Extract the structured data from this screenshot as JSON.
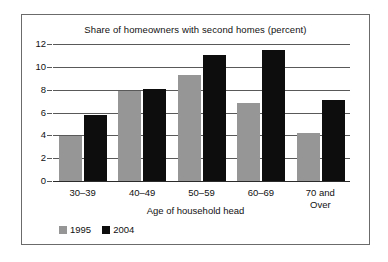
{
  "chart_data": {
    "type": "bar",
    "title": "Share of homeowners with second homes (percent)",
    "xlabel": "Age of household head",
    "ylabel": "",
    "categories": [
      "30–39",
      "40–49",
      "50–59",
      "60–69",
      "70 and Over"
    ],
    "category_lines": [
      [
        "30–39"
      ],
      [
        "40–49"
      ],
      [
        "50–59"
      ],
      [
        "60–69"
      ],
      [
        "70 and",
        "Over"
      ]
    ],
    "series": [
      {
        "name": "1995",
        "color": "#969696",
        "values": [
          3.9,
          7.9,
          9.3,
          6.8,
          4.2
        ]
      },
      {
        "name": "2004",
        "color": "#0d0d0d",
        "values": [
          5.8,
          8.1,
          11.0,
          11.5,
          7.1
        ]
      }
    ],
    "ylim": [
      0,
      12
    ],
    "yticks": [
      0,
      2,
      4,
      6,
      8,
      10,
      12
    ],
    "ytick_labels": [
      "0",
      "2",
      "4",
      "6",
      "8",
      "10",
      "12"
    ],
    "grid": true,
    "legend_position": "bottom-left",
    "legend_entries": [
      "1995",
      "2004"
    ]
  }
}
